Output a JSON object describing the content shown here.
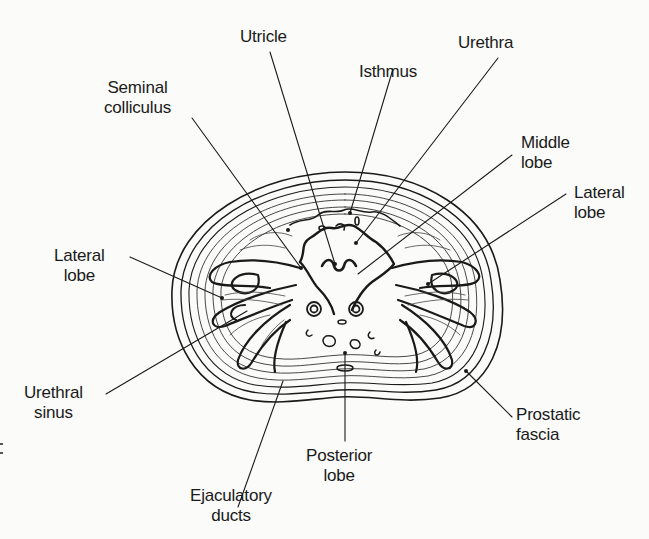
{
  "figure": {
    "type": "cross-section anatomical diagram",
    "colors": {
      "ink": "#1a1a1a",
      "paper": "#fbfbf9"
    }
  },
  "labels": {
    "utricle": {
      "lines": [
        "Utricle"
      ]
    },
    "urethra": {
      "lines": [
        "Urethra"
      ]
    },
    "isthmus": {
      "lines": [
        "Isthmus"
      ]
    },
    "seminal_colliculus": {
      "lines": [
        "Seminal",
        "colliculus"
      ]
    },
    "middle_lobe": {
      "lines": [
        "Middle",
        "lobe"
      ]
    },
    "lateral_lobe_right": {
      "lines": [
        "Lateral",
        "lobe"
      ]
    },
    "lateral_lobe_left": {
      "lines": [
        "Lateral",
        "lobe"
      ]
    },
    "urethral_sinus": {
      "lines": [
        "Urethral",
        "sinus"
      ]
    },
    "prostatic_fascia": {
      "lines": [
        "Prostatic",
        "fascia"
      ]
    },
    "posterior_lobe": {
      "lines": [
        "Posterior",
        "lobe"
      ]
    },
    "ejaculatory_ducts": {
      "lines": [
        "Ejaculatory",
        "ducts"
      ]
    }
  }
}
